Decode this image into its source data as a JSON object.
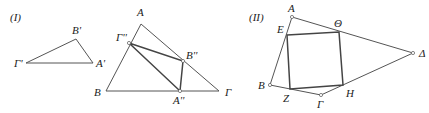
{
  "figures": [
    {
      "id": "I",
      "label": "(I)",
      "small_triangle": {
        "vertices": {
          "A_prime": "A'",
          "B_prime": "B'",
          "Gamma_prime": "Γ'"
        }
      },
      "big_triangle": {
        "vertices": {
          "A": "A",
          "B": "B",
          "Gamma": "Γ"
        }
      },
      "inscribed_triangle": {
        "vertices": {
          "A_dprime": "A''",
          "B_dprime": "B''",
          "Gamma_dprime": "Γ''"
        }
      }
    },
    {
      "id": "II",
      "label": "(II)",
      "quadrilateral": {
        "vertices": {
          "A": "A",
          "B": "B",
          "Gamma": "Γ",
          "Delta": "Δ"
        }
      },
      "inscribed_square": {
        "vertices": {
          "E": "E",
          "Z": "Z",
          "H": "H",
          "Theta": "Θ"
        }
      }
    }
  ]
}
